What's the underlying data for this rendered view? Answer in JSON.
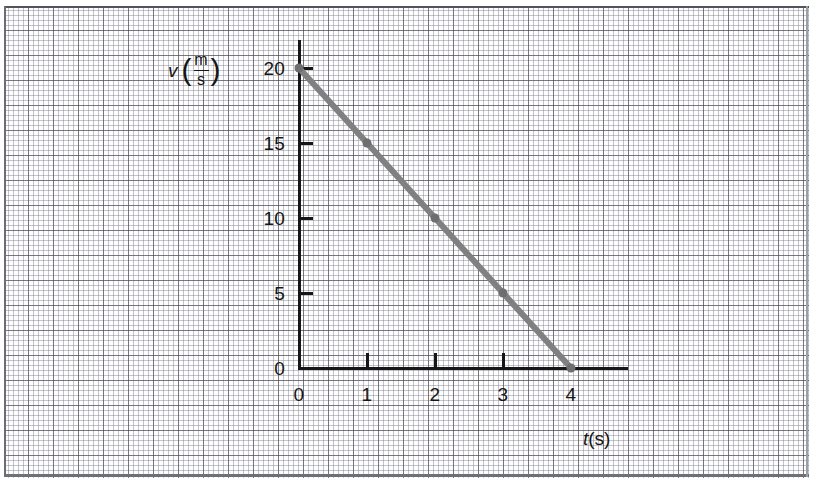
{
  "figure": {
    "width": 813,
    "height": 488,
    "background": "graph-paper",
    "paper_color": "#fdfdfd",
    "major_grid_color": "#46485",
    "minor_grid_color": "#6e707e"
  },
  "chart_data": {
    "type": "line",
    "title": "",
    "subtitle": "",
    "xlabel": "t(s)",
    "ylabel": "v (m/s)",
    "xlabel_parts": {
      "symbol": "t",
      "unit": "(s)"
    },
    "ylabel_parts": {
      "symbol": "v",
      "open": "(",
      "numerator": "m",
      "denominator": "s",
      "close": ")"
    },
    "x": [
      0,
      1,
      2,
      3,
      4
    ],
    "values": [
      20,
      15,
      10,
      5,
      0
    ],
    "series": [
      {
        "name": "velocity",
        "x": [
          0,
          1,
          2,
          3,
          4
        ],
        "values": [
          20,
          15,
          10,
          5,
          0
        ],
        "color": "#808080",
        "line_width": 6,
        "marker": "circle",
        "marker_size": 9,
        "marker_color": "#6e6e6e"
      }
    ],
    "slope": -5,
    "xlim": [
      0,
      4
    ],
    "ylim": [
      0,
      20
    ],
    "xticks": [
      0,
      1,
      2,
      3,
      4
    ],
    "yticks": [
      0,
      5,
      10,
      15,
      20
    ],
    "xtick_labels": [
      "0",
      "1",
      "2",
      "3",
      "4"
    ],
    "ytick_labels": [
      "0",
      "5",
      "10",
      "15",
      "20"
    ],
    "grid": true,
    "grid_style": "graph-paper",
    "legend": false,
    "legend_position": "none",
    "annotations": [],
    "axis_color": "#161616",
    "axis_style": "arrowless-L-axes"
  },
  "axes_geometry": {
    "origin_x": 299,
    "origin_y": 368,
    "x_axis_end": 628,
    "y_axis_top": 40,
    "px_per_x_unit": 68,
    "px_per_y_unit": 15
  }
}
